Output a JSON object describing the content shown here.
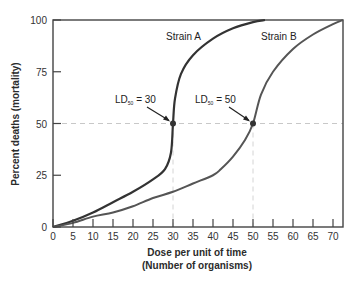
{
  "chart_data": {
    "type": "line",
    "title": "",
    "xlabel": "Dose per unit of time",
    "xlabel_line2": "(Number of organisms)",
    "ylabel": "Percent deaths (mortality)",
    "xlim": [
      0,
      72.5
    ],
    "ylim": [
      0,
      100
    ],
    "x_ticks": [
      0,
      5,
      10,
      15,
      20,
      25,
      30,
      35,
      40,
      45,
      50,
      55,
      60,
      65,
      70
    ],
    "y_ticks": [
      0,
      25,
      50,
      75,
      100
    ],
    "grid": false,
    "legend": "inline labels",
    "reference_lines": [
      {
        "type": "horizontal",
        "y": 50,
        "style": "dashed"
      },
      {
        "type": "vertical",
        "x": 30,
        "style": "dashed"
      },
      {
        "type": "vertical",
        "x": 50,
        "style": "dashed"
      }
    ],
    "series": [
      {
        "name": "Strain A",
        "color": "#333333",
        "x": [
          0,
          5,
          10,
          15,
          20,
          25,
          28,
          29.5,
          30,
          30.5,
          32,
          35,
          40,
          45,
          50,
          53
        ],
        "y": [
          0,
          3,
          7,
          12,
          17,
          23,
          28,
          36,
          50,
          62,
          74,
          83,
          91,
          96,
          99,
          100
        ]
      },
      {
        "name": "Strain B",
        "color": "#555555",
        "x": [
          0,
          5,
          10,
          15,
          20,
          25,
          30,
          35,
          40,
          42,
          45,
          48,
          50,
          52,
          55,
          60,
          65,
          70,
          72.5
        ],
        "y": [
          0,
          2,
          5,
          7,
          10,
          14,
          17,
          21,
          25,
          28,
          34,
          42,
          50,
          64,
          75,
          86,
          93,
          98,
          100
        ]
      }
    ],
    "annotations": [
      {
        "text": "Strain A",
        "x": 29,
        "y": 92
      },
      {
        "text": "Strain B",
        "x": 51,
        "y": 92
      },
      {
        "text_main": "LD",
        "text_sub": "50",
        "text_rest": " = 30",
        "point": [
          30,
          50
        ]
      },
      {
        "text_main": "LD",
        "text_sub": "50",
        "text_rest": " = 50",
        "point": [
          50,
          50
        ]
      }
    ]
  },
  "labels": {
    "strain_a": "Strain A",
    "strain_b": "Strain B",
    "ld_main": "LD",
    "ld_sub": "50",
    "ld_a_rest": " = 30",
    "ld_b_rest": " = 50",
    "xlabel1": "Dose per unit of time",
    "xlabel2": "(Number of organisms)",
    "ylabel": "Percent deaths (mortality)"
  }
}
